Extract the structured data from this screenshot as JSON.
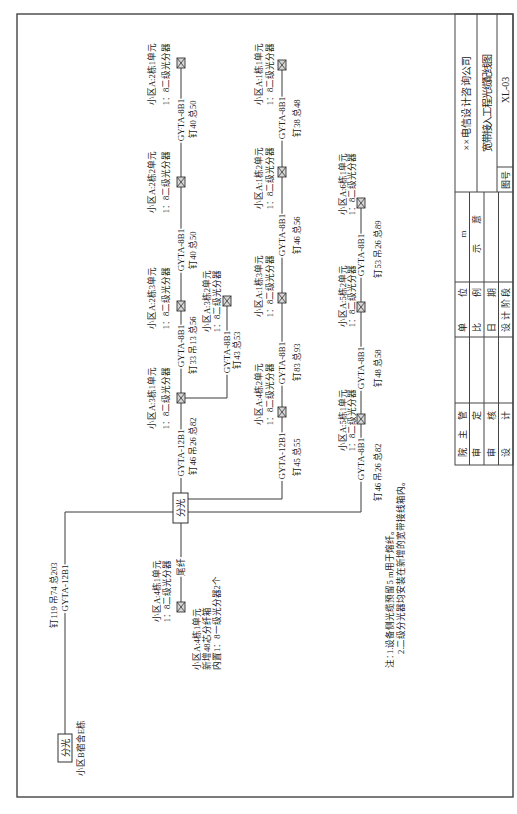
{
  "source": {
    "splitter_label": "分光",
    "location": "小区B宿舍E栋",
    "cable": "GYTA-12B1",
    "cable_length": "钉119 吊74 总203"
  },
  "main_splitter": {
    "label": "分光"
  },
  "tail": {
    "fiber_label": "尾纤",
    "splitter": {
      "name": "小区A:4栋1单元",
      "ratio": "1：8二级光分器"
    },
    "box_note": [
      "小区A:4栋1单元",
      "新增48芯分纤箱",
      "内置1：8一级光分器2个"
    ]
  },
  "row1": {
    "segments": [
      {
        "cable": "GYTA-12B1",
        "length": "钉46 吊26 总82"
      },
      {
        "cable": "GYTA-8B1",
        "length": "钉33 吊13 总56"
      },
      {
        "cable": "GYTA-8B1",
        "length": "钉40 总50"
      },
      {
        "cable": "GYTA-8B1",
        "length": "钉40 总50"
      }
    ],
    "splitters": [
      {
        "name": "小区A:3栋1单元",
        "ratio": "1：8二级光分器"
      },
      {
        "name": "小区A:2栋3单元",
        "ratio": "1：8二级光分器"
      },
      {
        "name": "小区A:2栋2单元",
        "ratio": "1：8二级光分器"
      },
      {
        "name": "小区A:2栋1单元",
        "ratio": "1：8二级光分器"
      }
    ]
  },
  "branch": {
    "segment": {
      "cable": "GYTA-8B1",
      "length": "钉43 总53"
    },
    "splitter": {
      "name": "小区A:3栋2单元",
      "ratio": "1：8二级光分器"
    }
  },
  "row2": {
    "segments": [
      {
        "cable": "GYTA-12B1",
        "length": "钉45 总55"
      },
      {
        "cable": "GYTA-8B1",
        "length": "钉83 总93"
      },
      {
        "cable": "GYTA-8B1",
        "length": "钉46 总56"
      },
      {
        "cable": "GYTA-8B1",
        "length": "钉38 总48"
      }
    ],
    "splitters": [
      {
        "name": "小区A:4栋2单元",
        "ratio": "1：8二级光分器"
      },
      {
        "name": "小区A:1栋3单元",
        "ratio": "1：8二级光分器"
      },
      {
        "name": "小区A:1栋2单元",
        "ratio": "1：8二级光分器"
      },
      {
        "name": "小区A:1栋1单元",
        "ratio": "1：8二级光分器"
      }
    ]
  },
  "row3": {
    "segments": [
      {
        "cable": "GYTA-8B1",
        "length": "钉46 吊26 总82"
      },
      {
        "cable": "GYTA-8B1",
        "length": "钉48 总58"
      },
      {
        "cable": "GYTA-8B1",
        "length": "钉53 吊26 总89"
      }
    ],
    "splitters": [
      {
        "name": "小区A:5栋1单元",
        "ratio": "1：8二级光分器"
      },
      {
        "name": "小区A:5栋2单元",
        "ratio": "1：8二级光分器"
      },
      {
        "name": "小区A:6栋1单元",
        "ratio": "1：8二级光分器"
      }
    ]
  },
  "notes": {
    "label": "注：",
    "items": [
      "1.设备侧光缆预留5 m用于熔纤。",
      "2.二级分光器均安装在新增的宽带接线箱内。"
    ]
  },
  "title_block": {
    "company": "××电信设计咨询公司",
    "drawing_title": "宽带接入工程光缆配线图",
    "drawing_no_label": "图号",
    "drawing_no": "XL-03",
    "roles": [
      "院主管",
      "审定",
      "审核",
      "设计"
    ],
    "meta_labels": [
      "单位",
      "比例",
      "日期",
      "设计阶段"
    ],
    "meta_values": [
      "m",
      "示意",
      "",
      ""
    ]
  }
}
